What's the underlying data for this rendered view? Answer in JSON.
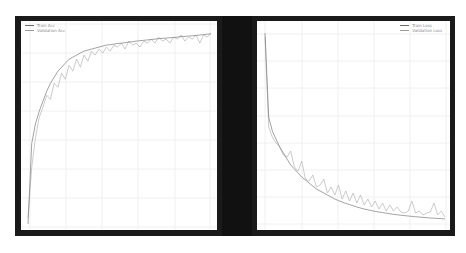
{
  "chart_data": [
    {
      "type": "line",
      "title": "",
      "xlabel": "",
      "ylabel": "",
      "grid": true,
      "legend_position": "upper left",
      "ylim": [
        0,
        1
      ],
      "x": [
        1,
        2,
        3,
        4,
        5,
        6,
        7,
        8,
        9,
        10,
        11,
        12,
        13,
        14,
        15,
        16,
        17,
        18,
        19,
        20,
        21,
        22,
        23,
        24,
        25,
        26,
        27,
        28,
        29,
        30,
        31,
        32,
        33,
        34,
        35,
        36,
        37,
        38,
        39,
        40,
        41,
        42,
        43,
        44,
        45,
        46,
        47,
        48,
        49,
        50
      ],
      "series": [
        {
          "name": "Train Acc",
          "color": "#7a7a7a",
          "values": [
            0.02,
            0.42,
            0.52,
            0.58,
            0.63,
            0.68,
            0.72,
            0.75,
            0.78,
            0.8,
            0.82,
            0.84,
            0.85,
            0.86,
            0.87,
            0.88,
            0.885,
            0.89,
            0.895,
            0.9,
            0.905,
            0.91,
            0.912,
            0.915,
            0.918,
            0.92,
            0.922,
            0.925,
            0.927,
            0.93,
            0.932,
            0.934,
            0.936,
            0.938,
            0.94,
            0.942,
            0.944,
            0.945,
            0.947,
            0.948,
            0.95,
            0.952,
            0.953,
            0.955,
            0.956,
            0.958,
            0.96,
            0.962,
            0.964,
            0.966
          ]
        },
        {
          "name": "Validation Acc",
          "color": "#b4b4b4",
          "values": [
            0.05,
            0.3,
            0.45,
            0.55,
            0.6,
            0.66,
            0.64,
            0.72,
            0.7,
            0.77,
            0.74,
            0.81,
            0.78,
            0.84,
            0.8,
            0.86,
            0.83,
            0.88,
            0.86,
            0.89,
            0.87,
            0.9,
            0.88,
            0.91,
            0.9,
            0.92,
            0.89,
            0.93,
            0.91,
            0.92,
            0.9,
            0.93,
            0.92,
            0.94,
            0.92,
            0.95,
            0.93,
            0.94,
            0.92,
            0.95,
            0.94,
            0.96,
            0.93,
            0.95,
            0.94,
            0.96,
            0.92,
            0.96,
            0.95,
            0.97
          ]
        }
      ]
    },
    {
      "type": "line",
      "title": "",
      "xlabel": "",
      "ylabel": "",
      "grid": true,
      "legend_position": "upper right",
      "ylim": [
        0,
        1
      ],
      "x": [
        1,
        2,
        3,
        4,
        5,
        6,
        7,
        8,
        9,
        10,
        11,
        12,
        13,
        14,
        15,
        16,
        17,
        18,
        19,
        20,
        21,
        22,
        23,
        24,
        25,
        26,
        27,
        28,
        29,
        30,
        31,
        32,
        33,
        34,
        35,
        36,
        37,
        38,
        39,
        40,
        41,
        42,
        43,
        44,
        45,
        46,
        47,
        48,
        49,
        50
      ],
      "series": [
        {
          "name": "Train Loss",
          "color": "#7a7a7a",
          "values": [
            0.97,
            0.55,
            0.48,
            0.44,
            0.4,
            0.37,
            0.34,
            0.31,
            0.29,
            0.27,
            0.25,
            0.235,
            0.22,
            0.205,
            0.19,
            0.18,
            0.17,
            0.16,
            0.15,
            0.14,
            0.132,
            0.125,
            0.118,
            0.112,
            0.106,
            0.1,
            0.095,
            0.09,
            0.086,
            0.082,
            0.078,
            0.075,
            0.072,
            0.069,
            0.066,
            0.063,
            0.061,
            0.059,
            0.057,
            0.055,
            0.053,
            0.051,
            0.05,
            0.048,
            0.047,
            0.045,
            0.044,
            0.043,
            0.042,
            0.04
          ]
        },
        {
          "name": "Validation Loss",
          "color": "#b4b4b4",
          "values": [
            0.95,
            0.5,
            0.45,
            0.42,
            0.4,
            0.36,
            0.35,
            0.38,
            0.3,
            0.28,
            0.33,
            0.24,
            0.23,
            0.26,
            0.2,
            0.21,
            0.24,
            0.17,
            0.2,
            0.16,
            0.21,
            0.14,
            0.18,
            0.13,
            0.17,
            0.12,
            0.16,
            0.11,
            0.14,
            0.1,
            0.13,
            0.09,
            0.12,
            0.08,
            0.11,
            0.08,
            0.1,
            0.075,
            0.07,
            0.08,
            0.13,
            0.07,
            0.08,
            0.06,
            0.07,
            0.075,
            0.12,
            0.06,
            0.08,
            0.05
          ]
        }
      ]
    }
  ],
  "charts": {
    "left": {
      "legend": [
        "Train Acc",
        "Validation Acc"
      ]
    },
    "right": {
      "legend": [
        "Train Loss",
        "Validation Loss"
      ]
    }
  }
}
